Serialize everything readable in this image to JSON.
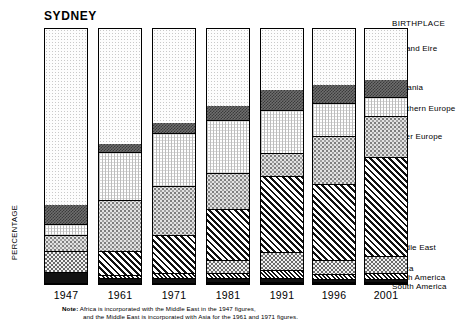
{
  "title": "SYDNEY",
  "axis": {
    "ylabel": "PERCENTAGE"
  },
  "legend": {
    "heading": "BIRTHPLACE",
    "items": [
      {
        "key": "uk",
        "label": "UK and Eire",
        "top": 44
      },
      {
        "key": "oceania",
        "label": "Oceania",
        "top": 83
      },
      {
        "key": "seurope",
        "label": "Southern Europe",
        "top": 104
      },
      {
        "key": "oeurope",
        "label": "Other Europe",
        "top": 132
      },
      {
        "key": "asia",
        "label": "Asia",
        "top": 196
      },
      {
        "key": "me",
        "label": "Middle East",
        "top": 243
      },
      {
        "key": "africa",
        "label": "Africa",
        "top": 264
      },
      {
        "key": "na",
        "label": "North America",
        "top": 273
      },
      {
        "key": "sa",
        "label": "South America",
        "top": 282
      }
    ]
  },
  "note": {
    "prefix": "Note:",
    "line1": " Africa is incorporated with the Middle East in the 1947 figures,",
    "line2": "and the Middle East is incorporated with Asia for the 1961 and 1971 figures."
  },
  "chart_data": {
    "type": "bar",
    "title": "SYDNEY",
    "xlabel": "",
    "ylabel": "PERCENTAGE",
    "ylim": [
      0,
      100
    ],
    "stacked": true,
    "grid": false,
    "legend_position": "right",
    "categories": [
      "1947",
      "1961",
      "1971",
      "1981",
      "1991",
      "1996",
      "2001"
    ],
    "series": [
      {
        "name": "UK and Eire",
        "key": "uk",
        "values": [
          69.0,
          45.0,
          37.0,
          30.0,
          24.0,
          22.0,
          20.0
        ]
      },
      {
        "name": "Oceania",
        "key": "oceania",
        "values": [
          8.0,
          3.5,
          4.0,
          6.0,
          8.0,
          7.5,
          7.0
        ]
      },
      {
        "name": "Southern Europe",
        "key": "seurope",
        "values": [
          4.0,
          19.0,
          21.0,
          21.0,
          17.0,
          13.0,
          7.5
        ]
      },
      {
        "name": "Other Europe",
        "key": "oeurope",
        "values": [
          6.5,
          20.0,
          19.0,
          14.0,
          9.0,
          18.5,
          16.0
        ]
      },
      {
        "name": "Asia",
        "key": "asia",
        "values": [
          0.0,
          9.5,
          15.0,
          20.0,
          30.0,
          30.0,
          39.0
        ]
      },
      {
        "name": "Middle East",
        "key": "me",
        "values": [
          8.0,
          0.0,
          0.0,
          5.0,
          7.0,
          5.5,
          6.5
        ]
      },
      {
        "name": "Africa",
        "key": "africa",
        "values": [
          0.0,
          1.0,
          2.0,
          2.0,
          3.0,
          2.0,
          2.5
        ]
      },
      {
        "name": "North America",
        "key": "na",
        "values": [
          4.5,
          2.0,
          2.0,
          1.5,
          1.5,
          1.0,
          1.0
        ]
      },
      {
        "name": "South America",
        "key": "sa",
        "values": [
          0.0,
          0.0,
          0.0,
          0.5,
          0.5,
          0.5,
          0.5
        ]
      }
    ]
  },
  "bars": [
    {
      "year": "1947",
      "left": 0
    },
    {
      "year": "1961",
      "left": 54
    },
    {
      "year": "1971",
      "left": 108
    },
    {
      "year": "1981",
      "left": 162
    },
    {
      "year": "1991",
      "left": 216
    },
    {
      "year": "1996",
      "left": 268
    },
    {
      "year": "2001",
      "left": 320
    }
  ]
}
